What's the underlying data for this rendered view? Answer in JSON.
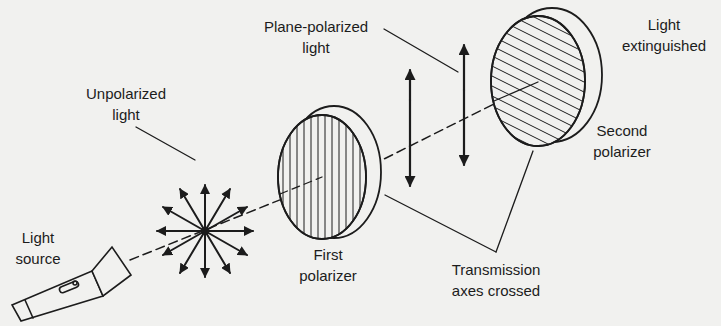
{
  "diagram": {
    "background_color": "#f1f1ef",
    "ink_color": "#1c1c1c",
    "labels": {
      "light_source": {
        "line1": "Light",
        "line2": "source"
      },
      "unpolarized_light": {
        "line1": "Unpolarized",
        "line2": "light"
      },
      "plane_polarized_light": {
        "line1": "Plane-polarized",
        "line2": "light"
      },
      "first_polarizer": {
        "line1": "First",
        "line2": "polarizer"
      },
      "second_polarizer": {
        "line1": "Second",
        "line2": "polarizer"
      },
      "light_extinguished": {
        "line1": "Light",
        "line2": "extinguished"
      },
      "transmission_axes": {
        "line1": "Transmission",
        "line2": "axes crossed"
      }
    },
    "components": [
      {
        "id": "flashlight",
        "name": "Light source (flashlight)"
      },
      {
        "id": "unpolarized-star",
        "name": "Unpolarized light vectors (12 directions)"
      },
      {
        "id": "first-polarizer",
        "name": "First polarizer",
        "hatching": "vertical"
      },
      {
        "id": "plane-polarized-arrows",
        "name": "Plane-polarized light (vertical double arrows)",
        "count": 2
      },
      {
        "id": "second-polarizer",
        "name": "Second polarizer",
        "hatching": "diagonal"
      }
    ]
  }
}
